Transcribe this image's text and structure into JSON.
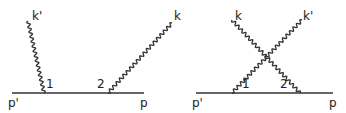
{
  "diagrams": [
    {
      "name": "direct",
      "labels": {
        "k_out": "k'",
        "k_in": "k",
        "vertex1": "1",
        "vertex2": "2",
        "p_out": "p'",
        "p_in": "p"
      }
    },
    {
      "name": "crossed",
      "labels": {
        "k_in": "k",
        "k_out": "k'",
        "vertex1": "1",
        "vertex2": "2",
        "p_out": "p'",
        "p_in": "p"
      }
    }
  ],
  "colors": {
    "line": "#333333"
  }
}
